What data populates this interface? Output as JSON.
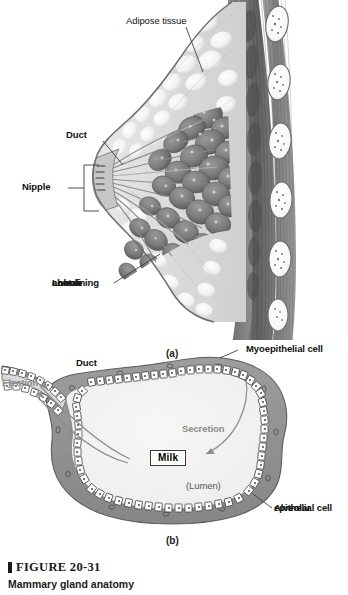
{
  "figure": {
    "caption_number": "FIGURE 20-31",
    "caption_title": "Mammary gland anatomy",
    "panel_a_tag": "(a)",
    "panel_b_tag": "(b)"
  },
  "panel_a": {
    "title": "Sagittal section of breast",
    "labels": {
      "adipose_tissue": "Adipose tissue",
      "duct": "Duct",
      "nipple": "Nipple",
      "lobule_line1": "Lobule",
      "lobule_line2": "containing",
      "lobule_line3": "alveoli"
    }
  },
  "panel_b": {
    "title": "Alveolus cross section",
    "labels": {
      "duct": "Duct",
      "ejection": "Ejection",
      "secretion": "Secretion",
      "milk": "Milk",
      "lumen": "(Lumen)",
      "myoepithelial_cell": "Myoepithelial cell",
      "alveolar_line1": "Alveolar",
      "alveolar_line2": "epithelial cell"
    }
  },
  "colors": {
    "background": "#ffffff",
    "skin_outline": "#6e6e6e",
    "adipose_fill": "#d9d9d9",
    "adipose_lobule": "#f0f0f0",
    "gland_dark": "#7a7a7a",
    "gland_darker": "#5f5f5f",
    "muscle_mid": "#8f8f8f",
    "muscle_dark": "#5a5a5a",
    "rib_fill": "#fafafa",
    "rib_outline": "#6b6b6b",
    "lumen_fill": "#f2f2f2",
    "myoepithelial_fill": "#8f8f8f",
    "epithelial_fill": "#ffffff",
    "epithelial_stroke": "#3d3d3d",
    "leader_line": "#4a4a4a",
    "gray_text": "#8c8c8c",
    "arrow_gray": "#8f8f8f",
    "text_black": "#111111"
  }
}
